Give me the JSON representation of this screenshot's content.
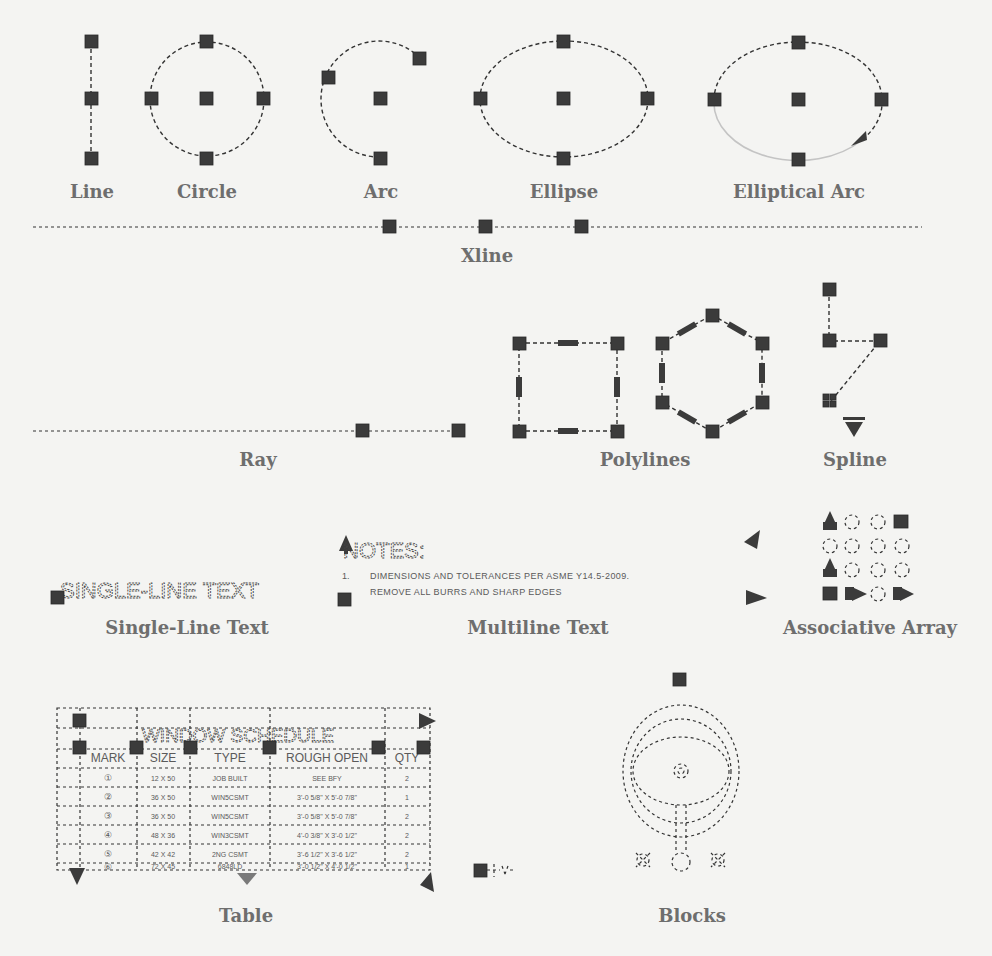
{
  "figure": {
    "background": "#f4f4f2",
    "grip_color": "#3b3b3b",
    "caption_color": "#6e6e6e"
  },
  "captions": {
    "line": "Line",
    "circle": "Circle",
    "arc": "Arc",
    "ellipse": "Ellipse",
    "elliptical_arc": "Elliptical Arc",
    "xline": "Xline",
    "ray": "Ray",
    "polylines": "Polylines",
    "spline": "Spline",
    "single_line_text": "Single-Line Text",
    "multiline_text": "Multiline Text",
    "associative_array": "Associative Array",
    "table": "Table",
    "blocks": "Blocks"
  },
  "single_line_text": {
    "content": "SINGLE-LINE TEXT"
  },
  "multiline_text": {
    "heading": "NOTES:",
    "lines": [
      {
        "num": "1.",
        "text": "DIMENSIONS AND TOLERANCES PER ASME Y14.5-2009."
      },
      {
        "num": "2.",
        "text": "REMOVE ALL BURRS AND SHARP EDGES"
      }
    ]
  },
  "table": {
    "title": "WINDOW SCHEDULE",
    "columns": [
      "MARK",
      "SIZE",
      "TYPE",
      "ROUGH OPEN",
      "QTY"
    ],
    "rows": [
      [
        "①",
        "12 X 50",
        "JOB BUILT",
        "SEE BFY",
        "2"
      ],
      [
        "②",
        "36 X 50",
        "WIN5CSMT",
        "3'-0 5/8\" X 5'-0 7/8\"",
        "1"
      ],
      [
        "③",
        "36 X 50",
        "WIN5CSMT",
        "3'-0 5/8\" X 5'-0 7/8\"",
        "2"
      ],
      [
        "④",
        "48 X 36",
        "WIN3CSMT",
        "4'-0 3/8\" X 3'-0 1/2\"",
        "2"
      ],
      [
        "⑤",
        "42 X 42",
        "2NG CSMT",
        "3'-6 1/2\" X 3'-6 1/2\"",
        "2"
      ],
      [
        "⑥",
        "72 X 45",
        "6848LD",
        "3'-0 1/2\" X 4'-0 1/2\"",
        "1"
      ]
    ]
  }
}
